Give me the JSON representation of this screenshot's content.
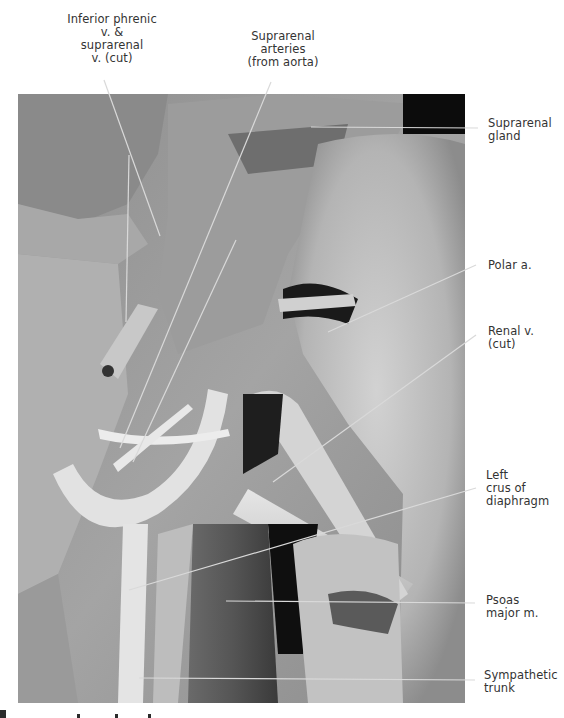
{
  "figure": {
    "photo_bounds": {
      "left": 18,
      "top": 94,
      "right": 465,
      "bottom": 703
    }
  },
  "labels": {
    "inferior_phrenic": [
      "Inferior phrenic",
      "v. &",
      "suprarenal",
      "v. (cut)"
    ],
    "suprarenal_arteries": [
      "Suprarenal",
      "arteries",
      "(from aorta)"
    ],
    "suprarenal_gland": [
      "Suprarenal",
      "gland"
    ],
    "polar_a": [
      "Polar a."
    ],
    "renal_v": [
      "Renal v.",
      "(cut)"
    ],
    "left_crus": [
      "Left",
      "crus of",
      "diaphragm"
    ],
    "psoas": [
      "Psoas",
      "major m."
    ],
    "sympathetic": [
      "Sympathetic",
      "trunk"
    ]
  },
  "leader_color": "#d8d8d8"
}
